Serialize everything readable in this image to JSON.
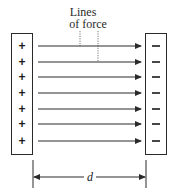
{
  "diagram": {
    "title_lines": [
      "Lines",
      "of force"
    ],
    "positive_plate": {
      "sign": "+",
      "count": 7
    },
    "negative_plate": {
      "sign": "−",
      "count": 7
    },
    "field_lines": {
      "count": 7,
      "direction": "left-to-right"
    },
    "dimension_label": "d",
    "colors": {
      "stroke": "#2a2a2a",
      "background": "#ffffff"
    }
  }
}
